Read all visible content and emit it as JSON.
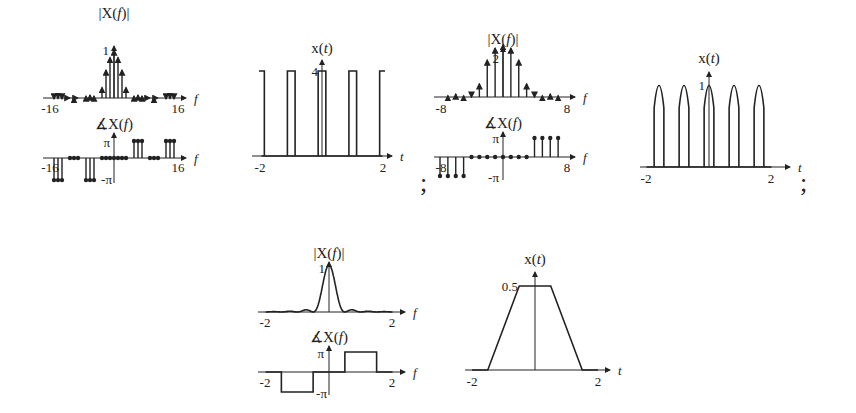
{
  "separators": [
    ";",
    ";"
  ],
  "chart_data": [
    {
      "id": "plot1-magnitude",
      "type": "bar",
      "title": "|X(f)|",
      "xlabel": "f",
      "ylabel": "|X(f)|",
      "xlim": [
        -16,
        16
      ],
      "ylim": [
        0,
        1
      ],
      "xticks": [
        "-16",
        "16"
      ],
      "yticks": [
        "1"
      ],
      "x": [
        -15,
        -14,
        -13,
        -11,
        -10,
        -9,
        -7,
        -6,
        -5,
        -3,
        -2,
        -1,
        0,
        1,
        2,
        3,
        5,
        6,
        7,
        9,
        10,
        11,
        13,
        14,
        15
      ],
      "values": [
        0.02,
        0.03,
        0.02,
        0.04,
        0.05,
        0.04,
        0.08,
        0.1,
        0.08,
        0.25,
        0.6,
        0.85,
        1.0,
        0.85,
        0.6,
        0.25,
        0.08,
        0.1,
        0.08,
        0.04,
        0.05,
        0.04,
        0.02,
        0.03,
        0.02
      ]
    },
    {
      "id": "plot1-phase",
      "type": "bar",
      "title": "∡X(f)",
      "xlabel": "f",
      "xlim": [
        -16,
        16
      ],
      "ylim": [
        -3.14159,
        3.14159
      ],
      "xticks": [
        "-16",
        "16"
      ],
      "yticks": [
        "π",
        "-π"
      ],
      "x": [
        -15,
        -14,
        -13,
        -11,
        -10,
        -9,
        -7,
        -6,
        -5,
        -3,
        -2,
        -1,
        0,
        1,
        2,
        3,
        5,
        6,
        7,
        9,
        10,
        11,
        13,
        14,
        15
      ],
      "values_in_pi": [
        -1,
        -1,
        -1,
        0,
        0,
        0,
        -1,
        -1,
        -1,
        0,
        0,
        0,
        0,
        0,
        0,
        0,
        1,
        1,
        1,
        0,
        0,
        0,
        1,
        1,
        1
      ]
    },
    {
      "id": "plot2-time",
      "type": "line",
      "title": "x(t)",
      "xlabel": "t",
      "xlim": [
        -2,
        2
      ],
      "ylim": [
        0,
        4
      ],
      "xticks": [
        "-2",
        "2"
      ],
      "yticks": [
        "4"
      ],
      "description": "Periodic rectangular pulse train, amplitude 4, period 1, pulse width 0.25",
      "pulses": [
        [
          -2.125,
          -1.875
        ],
        [
          -1.125,
          -0.875
        ],
        [
          -0.125,
          0.125
        ],
        [
          0.875,
          1.125
        ],
        [
          1.875,
          2.125
        ]
      ],
      "amplitude": 4
    },
    {
      "id": "plot3-magnitude",
      "type": "bar",
      "title": "|X(f)|",
      "xlabel": "f",
      "xlim": [
        -8,
        8
      ],
      "ylim": [
        0,
        2
      ],
      "xticks": [
        "-8",
        "8"
      ],
      "yticks": [
        "2"
      ],
      "x": [
        -7,
        -6,
        -5,
        -4,
        -3,
        -2,
        -1,
        0,
        1,
        2,
        3,
        4,
        5,
        6,
        7
      ],
      "values": [
        0.1,
        0.15,
        0.1,
        0.05,
        0.45,
        1.15,
        1.5,
        1.6,
        1.5,
        1.15,
        0.45,
        0.05,
        0.1,
        0.15,
        0.1
      ]
    },
    {
      "id": "plot3-phase",
      "type": "bar",
      "title": "∡X(f)",
      "xlabel": "f",
      "xlim": [
        -8,
        8
      ],
      "ylim": [
        -3.14159,
        3.14159
      ],
      "xticks": [
        "-8",
        "8"
      ],
      "yticks": [
        "π",
        "-π"
      ],
      "x": [
        -8,
        -7,
        -6,
        -5,
        -4,
        -3,
        -2,
        -1,
        0,
        1,
        2,
        3,
        4,
        5,
        6,
        7
      ],
      "values_in_pi": [
        -1,
        -1,
        -1,
        -1,
        0,
        0,
        0,
        0,
        0,
        0,
        0,
        0,
        1,
        1,
        1,
        1
      ]
    },
    {
      "id": "plot4-time",
      "type": "line",
      "title": "x(t)",
      "xlabel": "t",
      "xlim": [
        -2,
        2
      ],
      "ylim": [
        0,
        1
      ],
      "xticks": [
        "-2",
        "2"
      ],
      "yticks": [
        "1"
      ],
      "description": "Periodic train of truncated cosine-like arches, peak 1, period 0.8",
      "centers": [
        -1.6,
        -0.8,
        0,
        0.8,
        1.6
      ],
      "half_width": 0.12,
      "amplitude": 1
    },
    {
      "id": "plot5-magnitude",
      "type": "line",
      "title": "|X(f)|",
      "xlabel": "f",
      "xlim": [
        -2,
        2
      ],
      "ylim": [
        0,
        1
      ],
      "xticks": [
        "-2",
        "2"
      ],
      "yticks": [
        "1"
      ],
      "description": "sinc^2-like main lobe peaking at 1 at f=0, first nulls near ±0.5, small side lobes"
    },
    {
      "id": "plot5-phase",
      "type": "line",
      "title": "∡X(f)",
      "xlabel": "f",
      "xlim": [
        -2,
        2
      ],
      "ylim": [
        -3.14159,
        3.14159
      ],
      "xticks": [
        "-2",
        "2"
      ],
      "yticks": [
        "π",
        "-π"
      ],
      "segments": [
        {
          "f": [
            -2,
            -1.5
          ],
          "value_in_pi": 0
        },
        {
          "f": [
            -1.5,
            -0.5
          ],
          "value_in_pi": -1
        },
        {
          "f": [
            -0.5,
            0.5
          ],
          "value_in_pi": 0
        },
        {
          "f": [
            0.5,
            1.5
          ],
          "value_in_pi": 1
        },
        {
          "f": [
            1.5,
            2
          ],
          "value_in_pi": 0
        }
      ]
    },
    {
      "id": "plot6-time",
      "type": "line",
      "title": "x(t)",
      "xlabel": "t",
      "xlim": [
        -2,
        2
      ],
      "ylim": [
        0,
        0.5
      ],
      "xticks": [
        "-2",
        "2"
      ],
      "yticks": [
        "0.5"
      ],
      "description": "Trapezoid pulse",
      "x": [
        -2,
        -1.5,
        -0.5,
        0.5,
        1.5,
        2
      ],
      "values": [
        0,
        0,
        0.5,
        0.5,
        0,
        0
      ]
    }
  ]
}
